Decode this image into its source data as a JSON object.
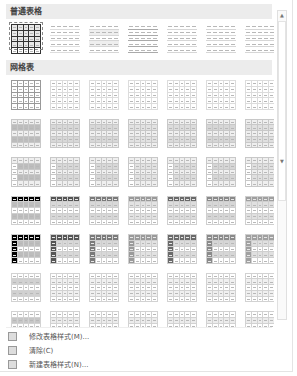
{
  "gallery": {
    "sections": [
      {
        "id": "plain",
        "title": "普通表格",
        "rows": 1
      },
      {
        "id": "grid",
        "title": "网格表",
        "rows": 7
      },
      {
        "id": "list",
        "title": "清单表",
        "rows": 1
      }
    ],
    "columns": 7,
    "selected": {
      "section": "plain",
      "row": 0,
      "col": 0
    }
  },
  "menu": {
    "items": [
      {
        "label": "修改表格样式(M)...",
        "icon": "modify-table-style-icon"
      },
      {
        "label": "清除(C)",
        "icon": "clear-icon"
      },
      {
        "label": "新建表格样式(N)...",
        "icon": "new-table-style-icon"
      }
    ]
  },
  "scrollbar": {
    "up": "▲",
    "down": "▼"
  },
  "colors": {
    "header_bg": "#ececec",
    "dark": "#222222",
    "mid": "#8a8a8a",
    "light": "#cfcfcf"
  }
}
